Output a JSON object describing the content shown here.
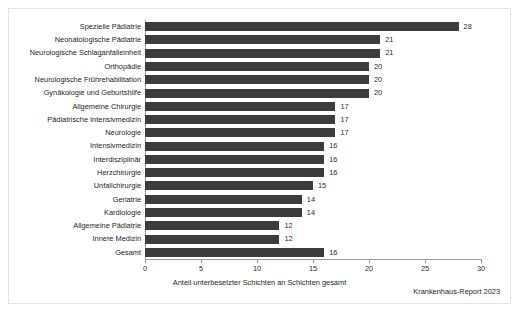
{
  "figure": {
    "source_note": "Krankenhaus-Report 2023",
    "bar_color": "#3c3c3c",
    "axis_color": "#9a9a9a",
    "frame_color": "#e3e3e3",
    "background": "#ffffff"
  },
  "chart_data": {
    "type": "bar",
    "orientation": "horizontal",
    "title": "",
    "subtitle": "",
    "xlabel": "Anteil unterbesetzter Schichten an Schichten gesamt",
    "ylabel": "",
    "xlim": [
      0,
      30
    ],
    "ylim": null,
    "xticks": [
      0,
      5,
      10,
      15,
      20,
      25,
      30
    ],
    "xtick_labels": [
      "0",
      "5",
      "10",
      "15",
      "20",
      "25",
      "30"
    ],
    "grid": false,
    "legend": null,
    "legend_position": "none",
    "categories": [
      "Spezielle Pädiatrie",
      "Neonatologische Pädiatrie",
      "Neurologische Schlaganfalleinheit",
      "Orthopädie",
      "Neurologische Frührehabilitation",
      "Gynäkologie und Geburtshilfe",
      "Allgemeine Chirurgie",
      "Pädiatrische Intensivmedizin",
      "Neurologie",
      "Intensivmedizin",
      "Interdisziplinär",
      "Herzchirurgie",
      "Unfallchirurgie",
      "Geriatrie",
      "Kardiologie",
      "Allgemeine Pädiatrie",
      "Innere Medizin",
      "Gesamt"
    ],
    "values": [
      28,
      21,
      21,
      20,
      20,
      20,
      17,
      17,
      17,
      16,
      16,
      16,
      15,
      14,
      14,
      12,
      12,
      16
    ],
    "value_labels": [
      "28",
      "21",
      "21",
      "20",
      "20",
      "20",
      "17",
      "17",
      "17",
      "16",
      "16",
      "16",
      "15",
      "14",
      "14",
      "12",
      "12",
      "16"
    ]
  }
}
